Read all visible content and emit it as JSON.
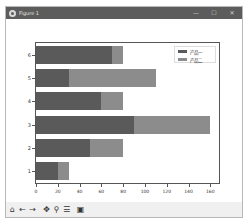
{
  "window": {
    "title": "Figure 1",
    "controls": [
      {
        "name": "minimize-button",
        "glyph": "—"
      },
      {
        "name": "maximize-button",
        "glyph": "☐"
      },
      {
        "name": "close-button",
        "glyph": "✕"
      }
    ]
  },
  "toolbar": {
    "buttons": [
      {
        "name": "home-button",
        "icon": "home-icon",
        "glyph": "⌂"
      },
      {
        "name": "back-button",
        "icon": "arrow-left-icon",
        "glyph": "←"
      },
      {
        "name": "forward-button",
        "icon": "arrow-right-icon",
        "glyph": "→"
      },
      {
        "name": "pan-button",
        "icon": "move-icon",
        "glyph": "✥"
      },
      {
        "name": "zoom-button",
        "icon": "magnifier-icon",
        "glyph": "⚲"
      },
      {
        "name": "configure-subplots-button",
        "icon": "sliders-icon",
        "glyph": "☰"
      },
      {
        "name": "save-button",
        "icon": "floppy-disk-icon",
        "glyph": "▣"
      }
    ]
  },
  "colors": {
    "series1": "#5a5a5a",
    "series2": "#8c8c8c",
    "titlebar": "#5c5c5c"
  },
  "chart_data": {
    "type": "bar",
    "orientation": "horizontal",
    "stacked": true,
    "title": "",
    "xlabel": "",
    "ylabel": "",
    "categories": [
      "1",
      "2",
      "3",
      "4",
      "5",
      "6"
    ],
    "series": [
      {
        "name": "产品一",
        "values": [
          20,
          50,
          90,
          60,
          30,
          70
        ]
      },
      {
        "name": "产品二",
        "values": [
          10,
          30,
          70,
          20,
          80,
          10
        ]
      }
    ],
    "xlim": [
      0,
      168
    ],
    "xticks": [
      0,
      20,
      40,
      60,
      80,
      100,
      120,
      140,
      160
    ],
    "grid": false,
    "legend_position": "upper right"
  }
}
